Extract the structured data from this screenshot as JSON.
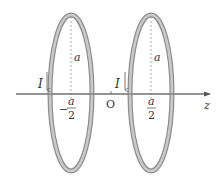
{
  "diagram": {
    "type": "physics-helmholtz-coils",
    "axis": {
      "label": "z",
      "origin_label": "O"
    },
    "coils": [
      {
        "name": "left-coil",
        "current_label": "I",
        "radius_label": "a",
        "position_sign": "−",
        "position_num": "a",
        "position_den": "2"
      },
      {
        "name": "right-coil",
        "current_label": "I",
        "radius_label": "a",
        "position_sign": "",
        "position_num": "a",
        "position_den": "2"
      }
    ],
    "colors": {
      "coil": "#8c8c8c",
      "coil_inner": "#c8c8c8",
      "axis": "#555555",
      "dashed": "#888888"
    }
  }
}
